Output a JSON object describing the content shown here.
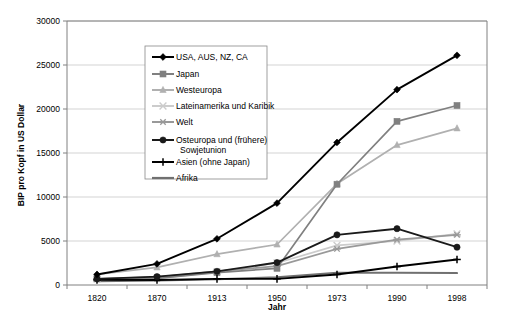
{
  "chart_data": {
    "type": "line",
    "title": "",
    "xlabel": "Jahr",
    "ylabel": "BIP pro Kopf in US Dollar",
    "categories": [
      "1820",
      "1870",
      "1913",
      "1950",
      "1973",
      "1990",
      "1998"
    ],
    "x": [
      1820,
      1870,
      1913,
      1950,
      1973,
      1990,
      1998
    ],
    "ylim": [
      0,
      30000
    ],
    "yticks": [
      0,
      5000,
      10000,
      15000,
      20000,
      25000,
      30000
    ],
    "ytick_labels": [
      "0",
      "5000",
      "10000",
      "15000",
      "20000",
      "25000",
      "30000"
    ],
    "grid": true,
    "legend_position": "upper-left-inside",
    "series": [
      {
        "name": "USA, AUS, NZ, CA",
        "color": "#000000",
        "marker": "diamond",
        "values": [
          1200,
          2400,
          5250,
          9300,
          16200,
          22200,
          26100
        ]
      },
      {
        "name": "Japan",
        "color": "#808080",
        "marker": "square",
        "values": [
          700,
          750,
          1400,
          1900,
          11450,
          18600,
          20400
        ]
      },
      {
        "name": "Westeuropa",
        "color": "#b0b0b0",
        "marker": "triangle",
        "values": [
          1200,
          2000,
          3500,
          4600,
          11500,
          15900,
          17800
        ]
      },
      {
        "name": "Lateinamerika und Karibik",
        "color": "#cccccc",
        "marker": "cross-x",
        "values": [
          700,
          750,
          1500,
          2500,
          4500,
          5000,
          5800
        ]
      },
      {
        "name": "Welt",
        "color": "#999999",
        "marker": "asterisk",
        "values": [
          700,
          900,
          1550,
          2150,
          4100,
          5150,
          5700
        ]
      },
      {
        "name": "Osteuropa und (frühere) Sowjetunion",
        "color": "#1a1a1a",
        "marker": "circle",
        "values": [
          700,
          950,
          1550,
          2550,
          5700,
          6400,
          4300
        ]
      },
      {
        "name": "Asien (ohne Japan)",
        "color": "#000000",
        "marker": "plus",
        "values": [
          580,
          560,
          700,
          700,
          1200,
          2100,
          2900
        ]
      },
      {
        "name": "Afrika",
        "color": "#707070",
        "marker": "none",
        "values": [
          420,
          500,
          640,
          890,
          1400,
          1400,
          1350
        ]
      }
    ]
  },
  "legend": {
    "entries": [
      {
        "label": "USA, AUS, NZ, CA"
      },
      {
        "label": "Japan"
      },
      {
        "label": "Westeuropa"
      },
      {
        "label": "Lateinamerika und Karibik"
      },
      {
        "label": "Welt"
      },
      {
        "label": "Osteuropa und (frühere)"
      },
      {
        "label": "Sowjetunion"
      },
      {
        "label": "Asien (ohne Japan)"
      },
      {
        "label": "Afrika"
      }
    ]
  }
}
